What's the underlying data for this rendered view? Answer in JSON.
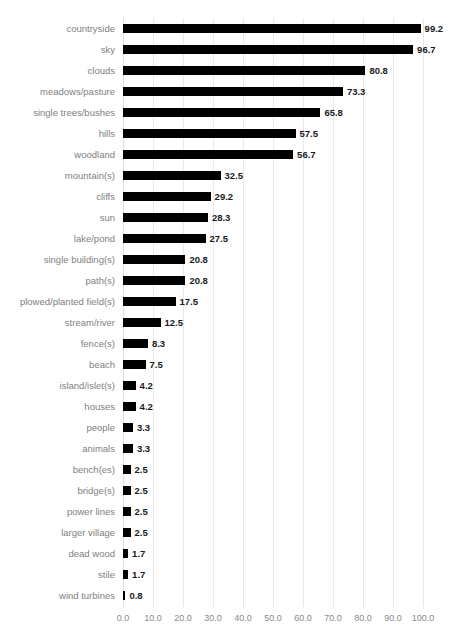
{
  "chart_data": {
    "type": "bar",
    "orientation": "horizontal",
    "title": "",
    "xlabel": "",
    "ylabel": "",
    "xlim": [
      0.0,
      100.0
    ],
    "xticks": [
      "0.0",
      "10.0",
      "20.0",
      "30.0",
      "40.0",
      "50.0",
      "60.0",
      "70.0",
      "80.0",
      "90.0",
      "100.0"
    ],
    "xtick_values": [
      0,
      10,
      20,
      30,
      40,
      50,
      60,
      70,
      80,
      90,
      100
    ],
    "grid": true,
    "legend": false,
    "bar_color": "#000000",
    "label_color": "#808080",
    "value_color": "#1a1a1a",
    "gridline_color": "#e8e8e8",
    "categories": [
      "countryside",
      "sky",
      "clouds",
      "meadows/pasture",
      "single trees/bushes",
      "hills",
      "woodland",
      "mountain(s)",
      "cliffs",
      "sun",
      "lake/pond",
      "single building(s)",
      "path(s)",
      "plowed/planted field(s)",
      "stream/river",
      "fence(s)",
      "beach",
      "island/islet(s)",
      "houses",
      "people",
      "animals",
      "bench(es)",
      "bridge(s)",
      "power lines",
      "larger village",
      "dead wood",
      "stile",
      "wind turbines"
    ],
    "values": [
      99.2,
      96.7,
      80.8,
      73.3,
      65.8,
      57.5,
      56.7,
      32.5,
      29.2,
      28.3,
      27.5,
      20.8,
      20.8,
      17.5,
      12.5,
      8.3,
      7.5,
      4.2,
      4.2,
      3.3,
      3.3,
      2.5,
      2.5,
      2.5,
      2.5,
      1.7,
      1.7,
      0.8
    ],
    "value_labels": [
      "99.2",
      "96.7",
      "80.8",
      "73.3",
      "65.8",
      "57.5",
      "56.7",
      "32.5",
      "29.2",
      "28.3",
      "27.5",
      "20.8",
      "20.8",
      "17.5",
      "12.5",
      "8.3",
      "7.5",
      "4.2",
      "4.2",
      "3.3",
      "3.3",
      "2.5",
      "2.5",
      "2.5",
      "2.5",
      "1.7",
      "1.7",
      "0.8"
    ]
  }
}
